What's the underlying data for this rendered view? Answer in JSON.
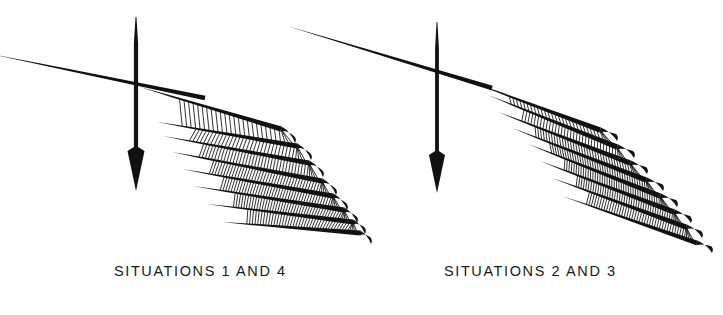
{
  "figure": {
    "background_color": "#fefefe",
    "ink_color": "#111111",
    "width": 723,
    "height": 315,
    "panels": [
      {
        "id": "left",
        "caption": "SITUATIONS 1 AND 4",
        "caption_x": 114,
        "caption_y": 263,
        "vertical_arrow": {
          "name": "downward-arrow",
          "x": 136,
          "y_top": 17,
          "y_tip": 191,
          "head_half_width": 8.5,
          "head_length": 44,
          "shaft_width": 4.2
        },
        "horizontal_axis": {
          "name": "oblique-axis-line",
          "x1": -4,
          "y1": 55,
          "x2": 205,
          "y2": 98,
          "thickness": 4.6
        },
        "hub": {
          "x": 137,
          "y": 87
        },
        "blade_count": 8,
        "blades": [
          {
            "x1": 140,
            "y1": 87,
            "x2": 281,
            "y2": 129,
            "tipdx": 14,
            "tipdy": 14,
            "w": 5.2,
            "hatch": 0
          },
          {
            "x1": 157,
            "y1": 122,
            "x2": 297,
            "y2": 146,
            "tipdx": 14,
            "tipdy": 14,
            "w": 5.0,
            "hatch": 26
          },
          {
            "x1": 163,
            "y1": 136,
            "x2": 309,
            "y2": 163,
            "tipdx": 14,
            "tipdy": 14,
            "w": 5.0,
            "hatch": 34
          },
          {
            "x1": 172,
            "y1": 152,
            "x2": 322,
            "y2": 181,
            "tipdx": 14,
            "tipdy": 14,
            "w": 5.2,
            "hatch": 40
          },
          {
            "x1": 182,
            "y1": 169,
            "x2": 333,
            "y2": 196,
            "tipdx": 14,
            "tipdy": 14,
            "w": 5.2,
            "hatch": 44
          },
          {
            "x1": 193,
            "y1": 186,
            "x2": 344,
            "y2": 210,
            "tipdx": 13,
            "tipdy": 13,
            "w": 5.2,
            "hatch": 46
          },
          {
            "x1": 207,
            "y1": 204,
            "x2": 353,
            "y2": 222,
            "tipdx": 12,
            "tipdy": 12,
            "w": 5.0,
            "hatch": 46
          },
          {
            "x1": 222,
            "y1": 222,
            "x2": 360,
            "y2": 233,
            "tipdx": 11,
            "tipdy": 11,
            "w": 4.8,
            "hatch": 42
          }
        ]
      },
      {
        "id": "right",
        "caption": "SITUATIONS 2 AND 3",
        "caption_x": 444,
        "caption_y": 263,
        "vertical_arrow": {
          "name": "downward-arrow",
          "x": 437,
          "y_top": 22,
          "y_tip": 193,
          "head_half_width": 8.0,
          "head_length": 42,
          "shaft_width": 3.8
        },
        "horizontal_axis": {
          "name": "oblique-axis-line",
          "x1": 287,
          "y1": 26,
          "x2": 492,
          "y2": 88,
          "thickness": 4.6
        },
        "hub": {
          "x": 470,
          "y": 80
        },
        "blade_count": 8,
        "blades": [
          {
            "x1": 474,
            "y1": 83,
            "x2": 600,
            "y2": 130,
            "tipdx": 17,
            "tipdy": 11,
            "w": 5.4,
            "hatch": 0
          },
          {
            "x1": 488,
            "y1": 95,
            "x2": 617,
            "y2": 147,
            "tipdx": 17,
            "tipdy": 11,
            "w": 5.4,
            "hatch": 30
          },
          {
            "x1": 498,
            "y1": 112,
            "x2": 630,
            "y2": 163,
            "tipdx": 17,
            "tipdy": 11,
            "w": 5.4,
            "hatch": 36
          },
          {
            "x1": 512,
            "y1": 128,
            "x2": 646,
            "y2": 180,
            "tipdx": 17,
            "tipdy": 11,
            "w": 5.4,
            "hatch": 40
          },
          {
            "x1": 528,
            "y1": 144,
            "x2": 660,
            "y2": 196,
            "tipdx": 17,
            "tipdy": 11,
            "w": 5.4,
            "hatch": 44
          },
          {
            "x1": 540,
            "y1": 161,
            "x2": 674,
            "y2": 212,
            "tipdx": 17,
            "tipdy": 11,
            "w": 5.4,
            "hatch": 46
          },
          {
            "x1": 552,
            "y1": 178,
            "x2": 686,
            "y2": 227,
            "tipdx": 16,
            "tipdy": 11,
            "w": 5.2,
            "hatch": 46
          },
          {
            "x1": 562,
            "y1": 196,
            "x2": 697,
            "y2": 243,
            "tipdx": 15,
            "tipdy": 10,
            "w": 5.0,
            "hatch": 44
          }
        ]
      }
    ]
  }
}
